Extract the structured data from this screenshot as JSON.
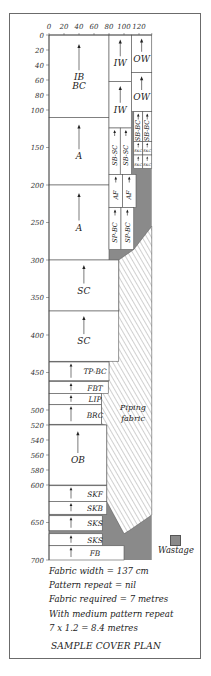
{
  "title": "SAMPLE COVER PLAN",
  "notes": [
    "Fabric width = 137 cm",
    "Pattern repeat = nil",
    "Fabric required = 7 metres",
    "With medium pattern repeat",
    "7 x 1.2 = 8.4 metres"
  ],
  "legend": {
    "label": "Wastage",
    "color": "#8a8a8a"
  },
  "colors": {
    "wastage": "#8a8a8a",
    "piece": "#ffffff",
    "line": "#555555",
    "hatch": "#777777"
  },
  "scale": {
    "x0": 49,
    "y0": 35,
    "px_per_cm": 0.75
  },
  "axes": {
    "x_ticks": [
      0,
      20,
      40,
      60,
      80,
      100,
      120
    ],
    "x_max": 137,
    "y_ticks": [
      0,
      20,
      40,
      60,
      80,
      100,
      150,
      200,
      250,
      300,
      350,
      400,
      450,
      500,
      520,
      540,
      560,
      580,
      600,
      650,
      700
    ]
  },
  "pieces": [
    {
      "label": "IB BC",
      "x": 0,
      "y": 0,
      "w": 80,
      "h": 110,
      "arrow": true,
      "vertical": false
    },
    {
      "label": "A",
      "x": 0,
      "y": 110,
      "w": 80,
      "h": 90,
      "arrow": true,
      "vertical": false
    },
    {
      "label": "A",
      "x": 0,
      "y": 200,
      "w": 80,
      "h": 100,
      "arrow": true,
      "vertical": false
    },
    {
      "label": "SC",
      "x": 0,
      "y": 300,
      "w": 93,
      "h": 68,
      "arrow": true,
      "vertical": false
    },
    {
      "label": "SC",
      "x": 0,
      "y": 368,
      "w": 93,
      "h": 67,
      "arrow": true,
      "vertical": false
    },
    {
      "label": "TP-BC",
      "x": 0,
      "y": 436,
      "w": 80,
      "h": 25,
      "arrow": true,
      "vertical": false
    },
    {
      "label": "FBT",
      "x": 0,
      "y": 462,
      "w": 79,
      "h": 16,
      "arrow": true,
      "vertical": false
    },
    {
      "label": "LIP",
      "x": 0,
      "y": 478,
      "w": 70,
      "h": 15,
      "arrow": true,
      "vertical": false
    },
    {
      "label": "BRC",
      "x": 0,
      "y": 493,
      "w": 70,
      "h": 26,
      "arrow": true,
      "vertical": false
    },
    {
      "label": "OB",
      "x": 0,
      "y": 520,
      "w": 77,
      "h": 80,
      "arrow": true,
      "vertical": false
    },
    {
      "label": "SKF",
      "x": 0,
      "y": 601,
      "w": 77,
      "h": 21,
      "arrow": true,
      "vertical": false
    },
    {
      "label": "SKB",
      "x": 0,
      "y": 622,
      "w": 77,
      "h": 17,
      "arrow": true,
      "vertical": false
    },
    {
      "label": "SKS",
      "x": 0,
      "y": 641,
      "w": 71,
      "h": 20,
      "arrow": true,
      "vertical": false
    },
    {
      "label": "SKS",
      "x": 0,
      "y": 665,
      "w": 71,
      "h": 16,
      "arrow": true,
      "vertical": false
    },
    {
      "label": "FB",
      "x": 0,
      "y": 681,
      "w": 100,
      "h": 19,
      "arrow": true,
      "vertical": false
    },
    {
      "label": "IW",
      "x": 80,
      "y": 0,
      "w": 30,
      "h": 62,
      "arrow": true,
      "vertical": false
    },
    {
      "label": "IW",
      "x": 80,
      "y": 62,
      "w": 30,
      "h": 62,
      "arrow": true,
      "vertical": false
    },
    {
      "label": "OW",
      "x": 110,
      "y": 0,
      "w": 27,
      "h": 50,
      "arrow": true,
      "vertical": false
    },
    {
      "label": "OW",
      "x": 110,
      "y": 50,
      "w": 27,
      "h": 52,
      "arrow": true,
      "vertical": false
    },
    {
      "label": "SB-SC",
      "x": 80,
      "y": 124,
      "w": 15,
      "h": 62,
      "arrow": true,
      "vertical": true
    },
    {
      "label": "SB-SC",
      "x": 95,
      "y": 124,
      "w": 15,
      "h": 62,
      "arrow": true,
      "vertical": true
    },
    {
      "label": "SB-BC",
      "x": 113,
      "y": 102,
      "w": 12,
      "h": 40,
      "arrow": true,
      "vertical": true
    },
    {
      "label": "SB-BC",
      "x": 125,
      "y": 102,
      "w": 12,
      "h": 40,
      "arrow": true,
      "vertical": true
    },
    {
      "label": "SKC",
      "x": 113,
      "y": 142,
      "w": 12,
      "h": 18,
      "arrow": true,
      "vertical": false,
      "small": true
    },
    {
      "label": "SKC",
      "x": 125,
      "y": 142,
      "w": 12,
      "h": 18,
      "arrow": true,
      "vertical": false,
      "small": true
    },
    {
      "label": "SKC",
      "x": 113,
      "y": 160,
      "w": 12,
      "h": 18,
      "arrow": true,
      "vertical": false,
      "small": true
    },
    {
      "label": "SKC",
      "x": 125,
      "y": 160,
      "w": 12,
      "h": 18,
      "arrow": true,
      "vertical": false,
      "small": true
    },
    {
      "label": "AF",
      "x": 80,
      "y": 186,
      "w": 18,
      "h": 44,
      "arrow": true,
      "vertical": true
    },
    {
      "label": "AF",
      "x": 98,
      "y": 186,
      "w": 18,
      "h": 44,
      "arrow": true,
      "vertical": true
    },
    {
      "label": "SP-BC",
      "x": 80,
      "y": 230,
      "w": 16,
      "h": 56,
      "arrow": true,
      "vertical": true
    },
    {
      "label": "SP-BC",
      "x": 96,
      "y": 230,
      "w": 17,
      "h": 56,
      "arrow": true,
      "vertical": true
    }
  ],
  "piping": {
    "label_line1": "Piping",
    "label_line2": "fabric",
    "polygon_cm": [
      [
        137,
        255
      ],
      [
        137,
        640
      ],
      [
        108,
        660
      ],
      [
        100,
        665
      ],
      [
        77,
        622
      ],
      [
        77,
        600
      ],
      [
        77,
        520
      ],
      [
        70,
        519
      ],
      [
        70,
        478
      ],
      [
        79,
        462
      ],
      [
        80,
        436
      ],
      [
        93,
        368
      ],
      [
        93,
        300
      ],
      [
        113,
        286
      ]
    ]
  },
  "wastage_polygon_cm": [
    [
      137,
      0
    ],
    [
      137,
      700
    ],
    [
      0,
      700
    ],
    [
      0,
      681
    ],
    [
      100,
      681
    ],
    [
      100,
      665
    ],
    [
      108,
      660
    ],
    [
      137,
      640
    ],
    [
      137,
      255
    ],
    [
      113,
      286
    ],
    [
      93,
      300
    ],
    [
      80,
      300
    ],
    [
      80,
      286
    ],
    [
      116,
      286
    ],
    [
      116,
      230
    ],
    [
      113,
      230
    ],
    [
      113,
      186
    ],
    [
      116,
      186
    ],
    [
      116,
      178
    ],
    [
      113,
      178
    ],
    [
      113,
      142
    ],
    [
      113,
      102
    ],
    [
      110,
      102
    ],
    [
      110,
      124
    ],
    [
      110,
      0
    ]
  ]
}
